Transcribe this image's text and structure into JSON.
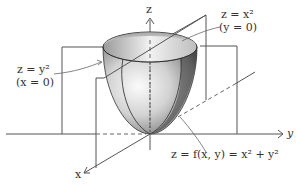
{
  "figure": {
    "type": "3d-surface-diagram",
    "surface": "paraboloid",
    "colors": {
      "background": "#ffffff",
      "axis": "#555555",
      "surface_light": "#f4f4f4",
      "surface_mid": "#b8b8b8",
      "surface_dark": "#4a4a4a",
      "text": "#333333"
    }
  },
  "axes": {
    "x_label": "x",
    "y_label": "y",
    "z_label": "z"
  },
  "annotations": {
    "trace_xz": {
      "eq": "z = x²",
      "cond": "(y = 0)"
    },
    "trace_yz": {
      "eq": "z = y²",
      "cond": "(x = 0)"
    },
    "surface": {
      "eq": "z = f(x, y) = x² + y²"
    }
  }
}
